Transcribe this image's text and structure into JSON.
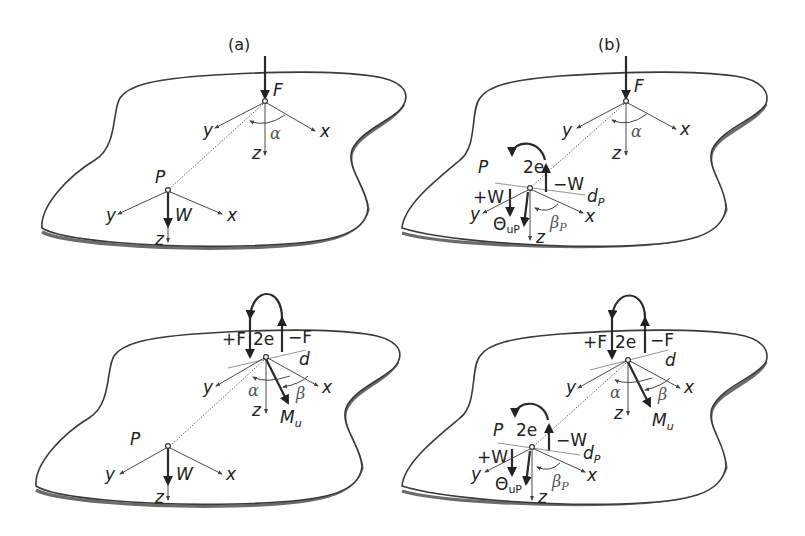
{
  "figure": {
    "panel_labels": [
      "(a)",
      "(b)"
    ],
    "panels": [
      {
        "id": "top-left",
        "column": "(a)",
        "labels": {
          "force": "F",
          "point": "P",
          "load": "W",
          "x": "x",
          "y": "y",
          "z": "z",
          "angle": "α"
        }
      },
      {
        "id": "top-right",
        "column": "(b)",
        "labels": {
          "force": "F",
          "point": "P",
          "x": "x",
          "y": "y",
          "z": "z",
          "angle": "α",
          "plus_load": "+W",
          "minus_load": "−W",
          "eccentricity": "2e",
          "rotation": "Θ",
          "rotation_sub": "uP",
          "line": "d",
          "line_sub": "P",
          "beta": "β",
          "beta_sub": "P"
        }
      },
      {
        "id": "bottom-left",
        "column": "(a)",
        "labels": {
          "plus_force": "+F",
          "minus_force": "−F",
          "eccentricity": "2e",
          "line": "d",
          "x": "x",
          "y": "y",
          "z": "z",
          "angle": "α",
          "beta": "β",
          "moment": "M",
          "moment_sub": "u",
          "point": "P",
          "load": "W"
        }
      },
      {
        "id": "bottom-right",
        "column": "(b)",
        "labels": {
          "plus_force": "+F",
          "minus_force": "−F",
          "eccentricity": "2e",
          "line": "d",
          "x": "x",
          "y": "y",
          "z": "z",
          "angle": "α",
          "beta": "β",
          "moment": "M",
          "moment_sub": "u",
          "point": "P",
          "plus_load": "+W",
          "minus_load": "−W",
          "eccentricity_p": "2e",
          "rotation": "Θ",
          "rotation_sub": "uP",
          "line_p": "d",
          "line_p_sub": "P",
          "beta_p": "β",
          "beta_p_sub": "P"
        }
      }
    ]
  }
}
